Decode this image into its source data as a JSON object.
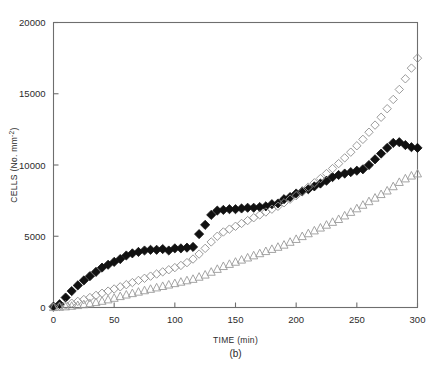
{
  "figure": {
    "caption": "(b)",
    "background": "#ffffff",
    "axis_color": "#6e6e6e"
  },
  "chart_data": {
    "type": "scatter",
    "title": "",
    "subtitle": "",
    "xlabel": "TIME (min)",
    "ylabel": "CELLS (No. mm⁻²)",
    "ylabel_parts": {
      "main": "CELLS (No. mm",
      "exponent": "-2",
      "tail": ")"
    },
    "xlim": [
      0,
      300
    ],
    "ylim": [
      0,
      20000
    ],
    "xticks": [
      0,
      50,
      100,
      150,
      200,
      250,
      300
    ],
    "xticklabels": [
      "0",
      "50",
      "100",
      "150",
      "200",
      "250",
      "300"
    ],
    "yticks": [
      0,
      5000,
      10000,
      15000,
      20000
    ],
    "yticklabels": [
      "0",
      "5000",
      "10000",
      "15000",
      "20000"
    ],
    "grid": false,
    "legend": "none",
    "frame": "box",
    "series": [
      {
        "name": "filled-diamond-series",
        "marker": "filled-diamond",
        "color": "#111111",
        "fill": "#111111",
        "size": 4.6,
        "x": [
          0,
          5,
          10,
          15,
          20,
          25,
          30,
          35,
          40,
          45,
          50,
          55,
          60,
          65,
          70,
          75,
          80,
          85,
          90,
          95,
          100,
          105,
          110,
          115,
          120,
          125,
          130,
          135,
          140,
          145,
          150,
          155,
          160,
          165,
          170,
          175,
          180,
          185,
          190,
          195,
          200,
          205,
          210,
          215,
          220,
          225,
          230,
          235,
          240,
          245,
          250,
          255,
          260,
          265,
          270,
          275,
          280,
          285,
          290,
          295,
          300
        ],
        "y": [
          60,
          230,
          700,
          1150,
          1550,
          1900,
          2200,
          2500,
          2800,
          3000,
          3200,
          3400,
          3650,
          3800,
          3900,
          4000,
          4050,
          4050,
          4100,
          4000,
          4150,
          4150,
          4200,
          4250,
          5150,
          5800,
          6500,
          6800,
          6850,
          6900,
          6900,
          6950,
          7000,
          7000,
          7050,
          7100,
          7250,
          7300,
          7600,
          7750,
          8000,
          8150,
          8300,
          8500,
          8700,
          8900,
          9150,
          9300,
          9400,
          9500,
          9600,
          9700,
          10000,
          10400,
          10800,
          11200,
          11550,
          11600,
          11400,
          11250,
          11200
        ]
      },
      {
        "name": "open-diamond-series",
        "marker": "open-diamond",
        "color": "#8e8e8e",
        "fill": "none",
        "size": 4.2,
        "x": [
          0,
          5,
          10,
          15,
          20,
          25,
          30,
          35,
          40,
          45,
          50,
          55,
          60,
          65,
          70,
          75,
          80,
          85,
          90,
          95,
          100,
          105,
          110,
          115,
          120,
          125,
          130,
          135,
          140,
          145,
          150,
          155,
          160,
          165,
          170,
          175,
          180,
          185,
          190,
          195,
          200,
          205,
          210,
          215,
          220,
          225,
          230,
          235,
          240,
          245,
          250,
          255,
          260,
          265,
          270,
          275,
          280,
          285,
          290,
          295,
          300
        ],
        "y": [
          30,
          80,
          180,
          300,
          430,
          560,
          700,
          850,
          1000,
          1150,
          1300,
          1450,
          1600,
          1750,
          1900,
          2050,
          2200,
          2350,
          2500,
          2650,
          2800,
          2950,
          3150,
          3400,
          3750,
          4150,
          4600,
          5000,
          5300,
          5500,
          5700,
          5900,
          6100,
          6300,
          6500,
          6700,
          6900,
          7100,
          7350,
          7600,
          7850,
          8150,
          8450,
          8750,
          9050,
          9400,
          9750,
          10100,
          10500,
          10900,
          11350,
          11800,
          12300,
          12800,
          13350,
          13950,
          14600,
          15300,
          16050,
          16800,
          17500
        ]
      },
      {
        "name": "open-triangle-series",
        "marker": "open-triangle",
        "color": "#9a9a9a",
        "fill": "none",
        "size": 4.2,
        "x": [
          0,
          5,
          10,
          15,
          20,
          25,
          30,
          35,
          40,
          45,
          50,
          55,
          60,
          65,
          70,
          75,
          80,
          85,
          90,
          95,
          100,
          105,
          110,
          115,
          120,
          125,
          130,
          135,
          140,
          145,
          150,
          155,
          160,
          165,
          170,
          175,
          180,
          185,
          190,
          195,
          200,
          205,
          210,
          215,
          220,
          225,
          230,
          235,
          240,
          245,
          250,
          255,
          260,
          265,
          270,
          275,
          280,
          285,
          290,
          295,
          300
        ],
        "y": [
          20,
          40,
          70,
          110,
          160,
          220,
          290,
          370,
          460,
          560,
          670,
          790,
          900,
          1000,
          1100,
          1200,
          1300,
          1400,
          1500,
          1600,
          1700,
          1800,
          1900,
          2000,
          2150,
          2300,
          2500,
          2700,
          2900,
          3050,
          3200,
          3350,
          3500,
          3650,
          3800,
          3950,
          4100,
          4250,
          4400,
          4600,
          4800,
          5000,
          5200,
          5400,
          5600,
          5800,
          6000,
          6200,
          6450,
          6700,
          6950,
          7200,
          7450,
          7700,
          7950,
          8200,
          8500,
          8800,
          9050,
          9250,
          9400
        ]
      }
    ]
  }
}
